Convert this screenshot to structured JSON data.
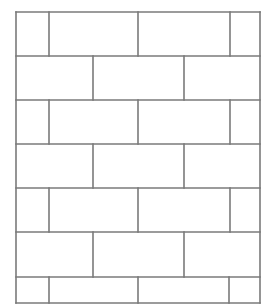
{
  "diagram": {
    "title": "",
    "type": "running-bond-brick-pattern",
    "line_color": "#7a7a7a",
    "background": "#ffffff",
    "line_width": 1.6,
    "frame": {
      "left": 16,
      "top": 12,
      "right": 260,
      "bottom": 303
    },
    "row_boundaries": [
      12,
      56,
      100,
      144,
      188,
      232,
      277,
      303
    ],
    "rows": [
      {
        "index": 0,
        "verticals": [
          49,
          138,
          230
        ]
      },
      {
        "index": 1,
        "verticals": [
          93,
          184
        ]
      },
      {
        "index": 2,
        "verticals": [
          49,
          138,
          230
        ]
      },
      {
        "index": 3,
        "verticals": [
          93,
          184
        ]
      },
      {
        "index": 4,
        "verticals": [
          49,
          138,
          230
        ]
      },
      {
        "index": 5,
        "verticals": [
          93,
          184
        ]
      },
      {
        "index": 6,
        "verticals": [
          49,
          138,
          229
        ]
      }
    ]
  }
}
